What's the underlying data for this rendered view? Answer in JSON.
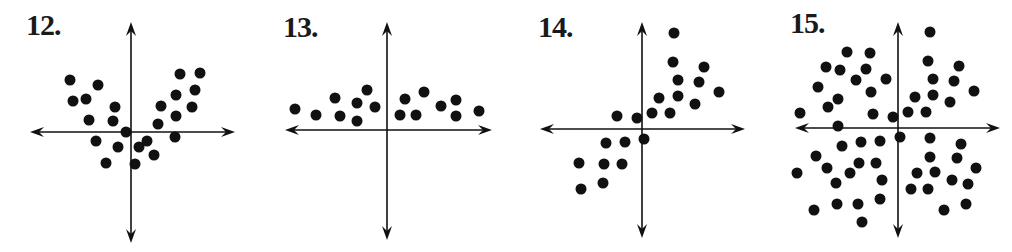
{
  "chart_data": [
    {
      "type": "scatter",
      "title": "12.",
      "panel": {
        "left": 0,
        "width": 250
      },
      "label_pos": [
        26,
        10
      ],
      "axes": {
        "x_line": [
          30,
          235
        ],
        "y_line": [
          22,
          243
        ],
        "origin": [
          131,
          132
        ]
      },
      "points": [
        [
          70,
          80
        ],
        [
          73,
          101
        ],
        [
          86,
          99
        ],
        [
          98,
          85
        ],
        [
          89,
          120
        ],
        [
          115,
          107
        ],
        [
          113,
          121
        ],
        [
          126,
          132
        ],
        [
          96,
          141
        ],
        [
          118,
          147
        ],
        [
          106,
          163
        ],
        [
          135,
          164
        ],
        [
          139,
          147
        ],
        [
          147,
          141
        ],
        [
          154,
          155
        ],
        [
          161,
          106
        ],
        [
          158,
          124
        ],
        [
          180,
          74
        ],
        [
          200,
          73
        ],
        [
          176,
          95
        ],
        [
          195,
          90
        ],
        [
          192,
          107
        ],
        [
          176,
          116
        ],
        [
          175,
          137
        ]
      ],
      "grid": false
    },
    {
      "type": "scatter",
      "title": "13.",
      "panel": {
        "left": 250,
        "width": 250
      },
      "label_pos": [
        283,
        12
      ],
      "axes": {
        "x_line": [
          285,
          492
        ],
        "y_line": [
          22,
          240
        ],
        "origin": [
          387,
          130
        ]
      },
      "points": [
        [
          295,
          109
        ],
        [
          316,
          115
        ],
        [
          335,
          98
        ],
        [
          340,
          116
        ],
        [
          357,
          103
        ],
        [
          357,
          121
        ],
        [
          367,
          90
        ],
        [
          375,
          107
        ],
        [
          400,
          115
        ],
        [
          405,
          99
        ],
        [
          416,
          115
        ],
        [
          424,
          92
        ],
        [
          441,
          106
        ],
        [
          456,
          100
        ],
        [
          456,
          116
        ],
        [
          479,
          111
        ]
      ],
      "grid": false
    },
    {
      "type": "scatter",
      "title": "14.",
      "panel": {
        "left": 500,
        "width": 260
      },
      "label_pos": [
        538,
        12
      ],
      "axes": {
        "x_line": [
          540,
          745
        ],
        "y_line": [
          22,
          238
        ],
        "origin": [
          642,
          129
        ]
      },
      "points": [
        [
          674,
          33
        ],
        [
          673,
          62
        ],
        [
          678,
          80
        ],
        [
          704,
          67
        ],
        [
          699,
          82
        ],
        [
          719,
          92
        ],
        [
          659,
          98
        ],
        [
          678,
          96
        ],
        [
          695,
          104
        ],
        [
          652,
          113
        ],
        [
          670,
          113
        ],
        [
          617,
          116
        ],
        [
          637,
          118
        ],
        [
          644,
          139
        ],
        [
          606,
          143
        ],
        [
          625,
          142
        ],
        [
          579,
          163
        ],
        [
          604,
          164
        ],
        [
          622,
          164
        ],
        [
          581,
          189
        ],
        [
          603,
          183
        ]
      ],
      "grid": false
    },
    {
      "type": "scatter",
      "title": "15.",
      "panel": {
        "left": 770,
        "width": 242
      },
      "label_pos": [
        790,
        8
      ],
      "axes": {
        "x_line": [
          795,
          1000
        ],
        "y_line": [
          22,
          238
        ],
        "origin": [
          898,
          128
        ]
      },
      "points": [
        [
          930,
          32
        ],
        [
          847,
          52
        ],
        [
          870,
          53
        ],
        [
          826,
          67
        ],
        [
          840,
          70
        ],
        [
          866,
          69
        ],
        [
          928,
          61
        ],
        [
          959,
          66
        ],
        [
          856,
          80
        ],
        [
          886,
          79
        ],
        [
          933,
          79
        ],
        [
          954,
          81
        ],
        [
          818,
          87
        ],
        [
          871,
          92
        ],
        [
          838,
          99
        ],
        [
          915,
          97
        ],
        [
          933,
          95
        ],
        [
          974,
          91
        ],
        [
          828,
          107
        ],
        [
          950,
          102
        ],
        [
          800,
          113
        ],
        [
          873,
          114
        ],
        [
          893,
          117
        ],
        [
          908,
          112
        ],
        [
          926,
          112
        ],
        [
          838,
          126
        ],
        [
          900,
          137
        ],
        [
          930,
          138
        ],
        [
          842,
          146
        ],
        [
          861,
          142
        ],
        [
          880,
          141
        ],
        [
          961,
          144
        ],
        [
          816,
          156
        ],
        [
          930,
          157
        ],
        [
          957,
          158
        ],
        [
          827,
          168
        ],
        [
          859,
          163
        ],
        [
          876,
          163
        ],
        [
          797,
          173
        ],
        [
          850,
          173
        ],
        [
          917,
          173
        ],
        [
          935,
          172
        ],
        [
          976,
          168
        ],
        [
          836,
          183
        ],
        [
          882,
          180
        ],
        [
          952,
          180
        ],
        [
          968,
          184
        ],
        [
          911,
          189
        ],
        [
          928,
          189
        ],
        [
          814,
          210
        ],
        [
          837,
          204
        ],
        [
          858,
          204
        ],
        [
          880,
          199
        ],
        [
          944,
          210
        ],
        [
          966,
          204
        ],
        [
          862,
          222
        ]
      ],
      "grid": false
    }
  ],
  "style": {
    "ink": "#111111",
    "dot_radius": 5.5
  }
}
